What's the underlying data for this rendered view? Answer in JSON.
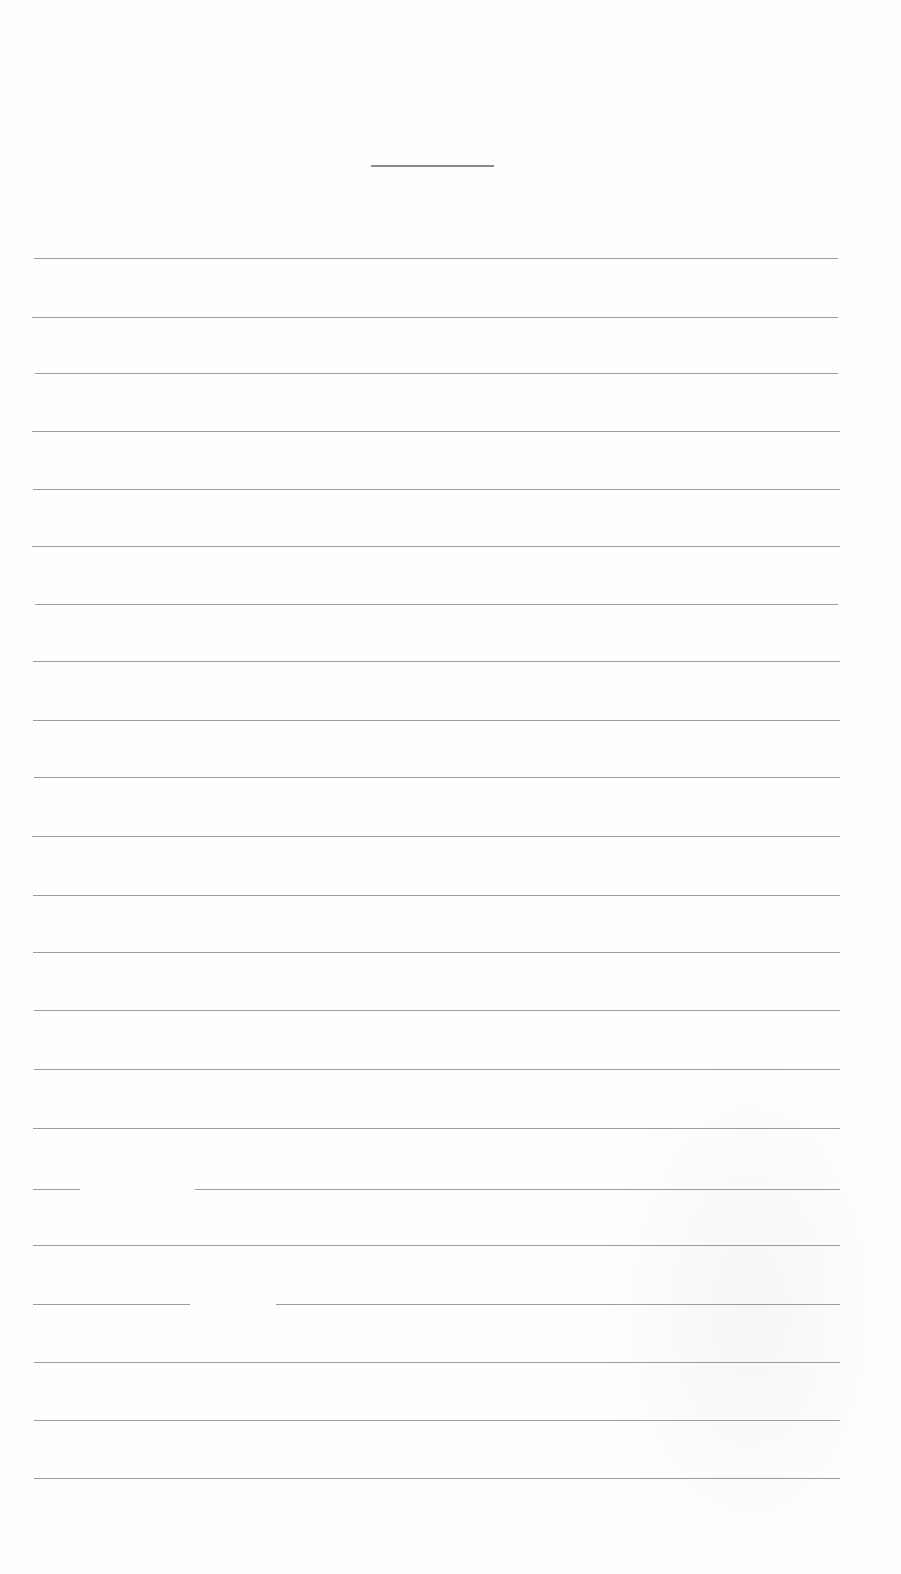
{
  "page": {
    "type": "blank lined writing sheet",
    "background": "#fefefe",
    "line_color": "#9c9c9c"
  },
  "title_line": {
    "x1": 371,
    "x2": 494,
    "y": 165
  },
  "rules": [
    {
      "y": 258,
      "x1": 34,
      "x2": 838
    },
    {
      "y": 317,
      "x1": 32,
      "x2": 838
    },
    {
      "y": 373,
      "x1": 35,
      "x2": 838
    },
    {
      "y": 431,
      "x1": 32,
      "x2": 840
    },
    {
      "y": 489,
      "x1": 33,
      "x2": 840
    },
    {
      "y": 546,
      "x1": 32,
      "x2": 840
    },
    {
      "y": 604,
      "x1": 35,
      "x2": 838
    },
    {
      "y": 661,
      "x1": 33,
      "x2": 840
    },
    {
      "y": 720,
      "x1": 33,
      "x2": 840
    },
    {
      "y": 777,
      "x1": 34,
      "x2": 840
    },
    {
      "y": 836,
      "x1": 32,
      "x2": 840
    },
    {
      "y": 895,
      "x1": 33,
      "x2": 840
    },
    {
      "y": 952,
      "x1": 33,
      "x2": 840
    },
    {
      "y": 1010,
      "x1": 34,
      "x2": 840
    },
    {
      "y": 1069,
      "x1": 34,
      "x2": 840
    },
    {
      "y": 1128,
      "x1": 33,
      "x2": 840,
      "segments": [
        [
          33,
          840
        ]
      ]
    },
    {
      "y": 1189,
      "x1": 33,
      "x2": 840,
      "segments": [
        [
          33,
          80
        ],
        [
          195,
          840
        ]
      ]
    },
    {
      "y": 1245,
      "x1": 33,
      "x2": 840
    },
    {
      "y": 1304,
      "x1": 33,
      "x2": 840,
      "segments": [
        [
          33,
          190
        ],
        [
          276,
          840
        ]
      ]
    },
    {
      "y": 1362,
      "x1": 34,
      "x2": 840
    },
    {
      "y": 1420,
      "x1": 34,
      "x2": 840
    },
    {
      "y": 1478,
      "x1": 34,
      "x2": 840
    }
  ]
}
